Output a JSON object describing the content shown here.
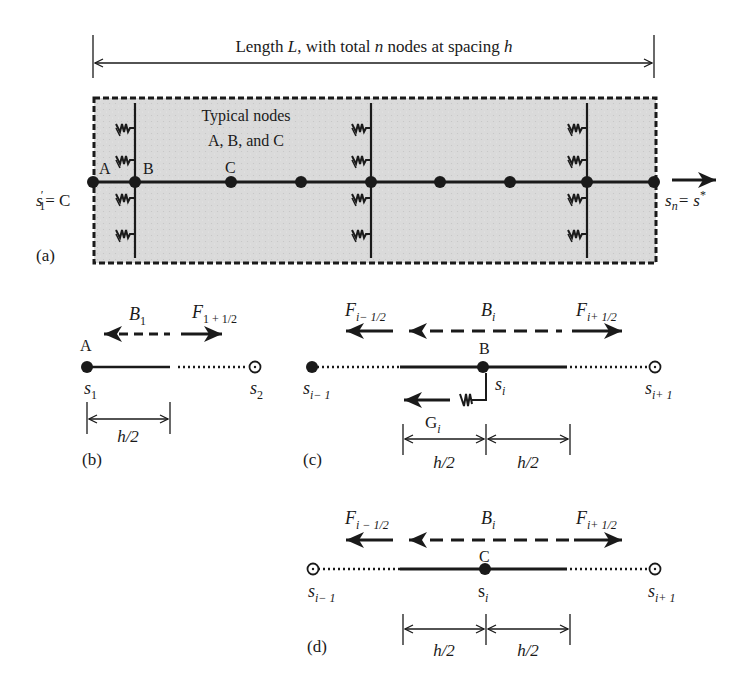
{
  "figure": {
    "panel_a": {
      "tag": "(a)",
      "length_label": "Length L, with total n nodes at spacing h",
      "length_label_parts": {
        "pre": "Length ",
        "L": "L",
        "mid": ", with total ",
        "n": "n",
        "post": " nodes at spacing ",
        "h": "h"
      },
      "typical_nodes_line1": "Typical nodes",
      "typical_nodes_line2": "A, B, and C",
      "node_labels": [
        "A",
        "B",
        "C"
      ],
      "left_boundary": {
        "s": "s",
        "prime": "′",
        "sub": "1",
        "eq": "= C"
      },
      "right_boundary": {
        "s": "s",
        "sub": "n",
        "eq": "= s",
        "sup": "*"
      },
      "node_count": 9,
      "spring_columns": 3,
      "springs_per_column": 4
    },
    "panel_b": {
      "tag": "(b)",
      "node_label": "A",
      "B_label": {
        "main": "B",
        "sub": "1"
      },
      "F_label": {
        "main": "F",
        "sub": "1 + 1/2"
      },
      "s_left": {
        "main": "s",
        "sub": "1"
      },
      "s_right": {
        "main": "s",
        "sub": "2"
      },
      "dim_label": "h/2"
    },
    "panel_c": {
      "tag": "(c)",
      "node_label": "B",
      "F_left": {
        "main": "F",
        "sub": "i− 1/2"
      },
      "B_label": {
        "main": "B",
        "sub": "i"
      },
      "F_right": {
        "main": "F",
        "sub": "i+ 1/2"
      },
      "s_left": {
        "main": "s",
        "sub": "i− 1"
      },
      "s_mid": {
        "main": "s",
        "sub": "i"
      },
      "s_right": {
        "main": "s",
        "sub": "i+ 1"
      },
      "G_label": {
        "main": "G",
        "sub": "i"
      },
      "dim_left": "h/2",
      "dim_right": "h/2"
    },
    "panel_d": {
      "tag": "(d)",
      "node_label": "C",
      "F_left": {
        "main": "F",
        "sub": "i − 1/2"
      },
      "B_label": {
        "main": "B",
        "sub": "i"
      },
      "F_right": {
        "main": "F",
        "sub": "i+ 1/2"
      },
      "s_left": {
        "main": "s",
        "sub": "i− 1"
      },
      "s_mid": {
        "main": "s",
        "sub": "i"
      },
      "s_right": {
        "main": "s",
        "sub": "i+ 1"
      },
      "dim_left": "h/2",
      "dim_right": "h/2"
    },
    "colors": {
      "ink": "#1a1a1a",
      "soil_fill": "#d9d9d9",
      "background": "#ffffff"
    }
  }
}
